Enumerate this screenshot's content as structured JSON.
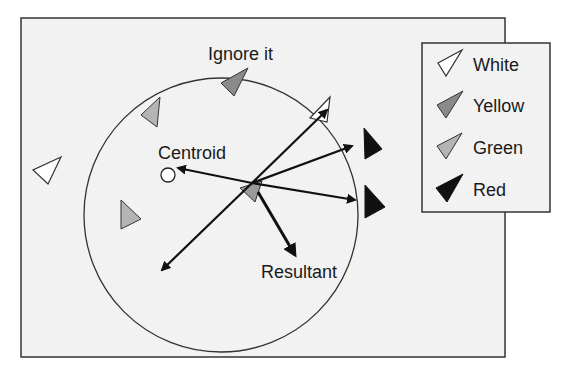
{
  "diagram": {
    "title": "",
    "labels": {
      "ignore": "Ignore it",
      "centroid": "Centroid",
      "resultant": "Resultant"
    },
    "legend": [
      {
        "label": "White",
        "color": "#ffffff"
      },
      {
        "label": "Yellow",
        "color": "#8a8a8a"
      },
      {
        "label": "Green",
        "color": "#b4b4b4"
      },
      {
        "label": "Red",
        "color": "#111111"
      }
    ],
    "colors": {
      "background": "#f2f2f2",
      "stroke": "#222222"
    }
  }
}
